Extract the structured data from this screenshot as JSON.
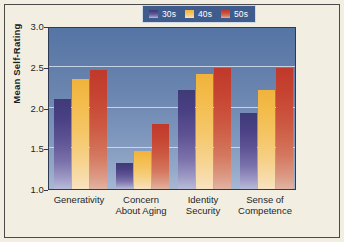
{
  "chart_data": {
    "type": "bar",
    "title": "",
    "xlabel": "",
    "ylabel": "Mean Self-Rating",
    "ylim": [
      1.0,
      3.0
    ],
    "yticks": [
      "1.0",
      "1.5",
      "2.0",
      "2.5",
      "3.0"
    ],
    "ytick_values": [
      1.0,
      1.5,
      2.0,
      2.5,
      3.0
    ],
    "grid": true,
    "legend_position": "top-right",
    "categories": [
      "Generativity",
      "Concern About Aging",
      "Identity Security",
      "Sense of Competence"
    ],
    "category_lines": [
      [
        "Generativity"
      ],
      [
        "Concern",
        "About Aging"
      ],
      [
        "Identity",
        "Security"
      ],
      [
        "Sense of",
        "Competence"
      ]
    ],
    "series": [
      {
        "name": "30s",
        "color": "#4a4184",
        "values": [
          2.1,
          1.32,
          2.21,
          1.93
        ]
      },
      {
        "name": "40s",
        "color": "#f3bc4c",
        "values": [
          2.35,
          1.47,
          2.41,
          2.22
        ]
      },
      {
        "name": "50s",
        "color": "#c64432",
        "values": [
          2.46,
          1.8,
          2.49,
          2.49
        ]
      }
    ]
  },
  "legend": {
    "items": [
      {
        "label": "30s"
      },
      {
        "label": "40s"
      },
      {
        "label": "50s"
      }
    ]
  },
  "colors": {
    "page_background": "#f2efe2",
    "frame_border": "#4a4a48",
    "plot_background_top": "#5575a5",
    "plot_background_bottom": "#a7b8d4",
    "gridline": "#d6e0ef",
    "legend_background": "#3f5c8c",
    "series_30s": "#4a4184",
    "series_40s": "#f3bc4c",
    "series_50s": "#c64432",
    "text": "#26262a"
  }
}
